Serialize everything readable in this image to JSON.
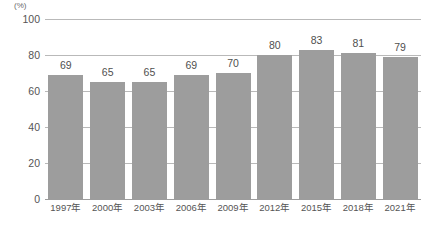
{
  "chart_data": {
    "type": "bar",
    "title": "",
    "subtitle": "",
    "xlabel": "",
    "ylabel": "",
    "unit_label": "(%)",
    "categories": [
      "1997年",
      "2000年",
      "2003年",
      "2006年",
      "2009年",
      "2012年",
      "2015年",
      "2018年",
      "2021年"
    ],
    "values": [
      69,
      65,
      65,
      69,
      70,
      80,
      83,
      81,
      79
    ],
    "ylim": [
      0,
      100
    ],
    "yticks": [
      100,
      80,
      60,
      40,
      20,
      0
    ],
    "ytick_labels": [
      "100",
      "80",
      "60",
      "40",
      "20",
      "0"
    ],
    "grid": true,
    "grid_axis": "y",
    "legend": false,
    "legend_position": "none",
    "data_labels": true,
    "series": [
      {
        "name": "",
        "values": [
          69,
          65,
          65,
          69,
          70,
          80,
          83,
          81,
          79
        ]
      }
    ],
    "colors": {
      "bar": "#9d9d9d",
      "gridline": "#b9b9b9",
      "baseline": "#9d9d9d",
      "text": "#555555",
      "background": "#ffffff"
    }
  }
}
